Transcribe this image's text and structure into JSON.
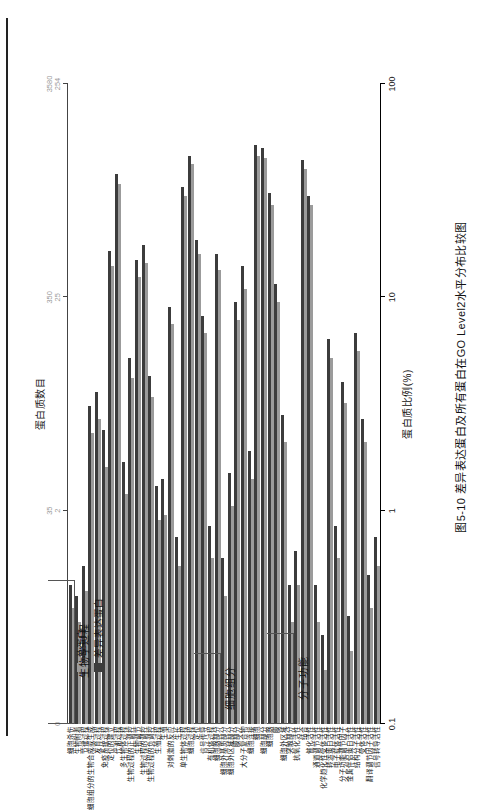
{
  "figure": {
    "caption": "图5-10  差异表达蛋白及所有蛋白在GO Level2水平分布比较图"
  },
  "legend": {
    "items": [
      {
        "label": "总蛋白",
        "color": "#9b9b9b",
        "key": "total"
      },
      {
        "label": "差异表达蛋白",
        "color": "#3c3c3c",
        "key": "deg"
      }
    ]
  },
  "axes": {
    "bottom": {
      "title": "蛋白质比例(%)",
      "ticks": [
        "0.1",
        "1",
        "10",
        "100"
      ],
      "scale": "log",
      "min": 0.1,
      "max": 100
    },
    "top": {
      "title": "蛋白质数目",
      "ticks": [
        "0",
        "35/2",
        "350/25",
        "3580/254"
      ]
    }
  },
  "groups": [
    {
      "name": "生物学过程",
      "start": 0,
      "end": 21
    },
    {
      "name": "细胞组分",
      "start": 22,
      "end": 32
    },
    {
      "name": "分子功能",
      "start": 33,
      "end": 46
    }
  ],
  "chart_data": {
    "type": "bar",
    "orientation": "horizontal",
    "title": "差异表达蛋白及所有蛋白在GO Level2水平分布比较图",
    "xlabel": "蛋白质比例(%)",
    "ylabel": "",
    "xscale": "log",
    "xlim": [
      0.1,
      100
    ],
    "xticks": [
      0.1,
      1,
      10,
      100
    ],
    "legend_position": "top-left",
    "grid": false,
    "categories": [
      "细胞杀伤",
      "生物附着",
      "节律过程",
      "细胞组分的生物合成或生成",
      "发育过程",
      "免疫系统过程",
      "定位的建立",
      "代谢过程",
      "多生物体过程",
      "生物过程的正调控",
      "生物调节",
      "生物过程的调控",
      "生物过程的负调控",
      "生殖过程",
      "生殖",
      "对刺激的反应",
      "生长",
      "单生物体过程",
      "细胞过程",
      "定位",
      "信号传导",
      "有机体过程",
      "细胞器部分",
      "细胞外基质部分",
      "细胞外区域部分",
      "膜部分",
      "大分子复合物",
      "细胞连接",
      "细胞",
      "细胞部分",
      "细胞器",
      "膜",
      "细胞外区域",
      "突触部分",
      "抗氧化活性",
      "结合",
      "催化活性",
      "通道调节活性",
      "化学趋化性受体活性",
      "转运蛋白活性",
      "电子载体活性",
      "分子功能调节因子",
      "金属伴侣蛋白活性",
      "结构分子活性",
      "受体活性",
      "翻译调节因子活性",
      "信号转导活性"
    ],
    "series": [
      {
        "name": "总蛋白",
        "color": "#9b9b9b",
        "values": [
          0.35,
          0.3,
          0.42,
          2.3,
          2.7,
          1.6,
          14.0,
          34.0,
          1.2,
          4.2,
          12.5,
          14.5,
          3.4,
          0.9,
          0.95,
          7.5,
          0.55,
          30.0,
          42.0,
          16.0,
          6.8,
          0.6,
          13.5,
          0.4,
          1.05,
          7.8,
          11.0,
          1.4,
          46.0,
          45.0,
          27.0,
          9.5,
          2.1,
          0.3,
          0.45,
          40.0,
          27.0,
          0.3,
          0.18,
          5.2,
          0.6,
          3.2,
          0.22,
          5.6,
          2.1,
          0.35,
          0.55
        ]
      },
      {
        "name": "差异表达蛋白",
        "color": "#3c3c3c",
        "values": [
          0.45,
          0.4,
          0.55,
          3.1,
          3.6,
          2.4,
          16.5,
          38.0,
          1.7,
          5.2,
          15.0,
          17.5,
          4.3,
          1.3,
          1.4,
          9.0,
          0.75,
          33.0,
          46.0,
          18.5,
          8.2,
          0.85,
          16.0,
          0.6,
          1.5,
          9.5,
          14.0,
          1.9,
          52.0,
          50.0,
          31.0,
          11.5,
          2.8,
          0.45,
          0.65,
          44.0,
          30.0,
          0.45,
          0.26,
          6.4,
          0.85,
          4.0,
          0.32,
          6.8,
          2.7,
          0.5,
          0.75
        ]
      }
    ]
  }
}
